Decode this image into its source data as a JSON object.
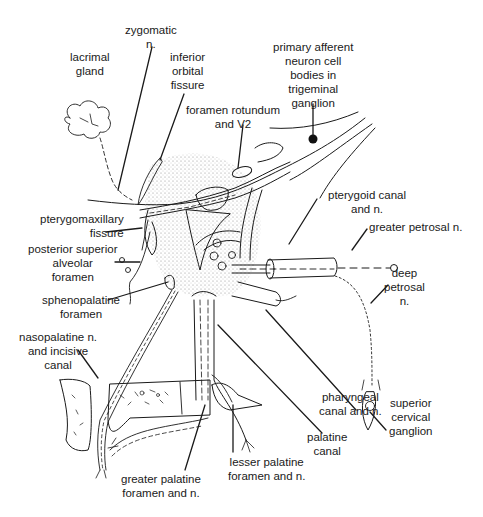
{
  "figure": {
    "colors": {
      "ink": "#1a1a1a",
      "background": "#ffffff",
      "stipple": "#9a9a9a"
    }
  },
  "labels": {
    "zygomatic_n": "zygomatic\nn.",
    "lacrimal_gland": "lacrimal\ngland",
    "inferior_orbital_fissure": "inferior\norbital\nfissure",
    "primary_afferent": "primary afferent\nneuron cell\nbodies in\ntrigeminal\nganglion",
    "foramen_rotundum": "foramen rotundum\nand V2",
    "pterygoid_canal": "pterygoid canal\nand n.",
    "greater_petrosal": "greater petrosal n.",
    "pterygomaxillary_fissure": "pterygomaxillary\nfissure",
    "posterior_superior_alveolar": "posterior superior\nalveolar\nforamen",
    "sphenopalatine_foramen": "sphenopalatine\nforamen",
    "deep_petrosal": "deep\npetrosal\nn.",
    "nasopalatine": "nasopalatine n.\nand incisive\ncanal",
    "superior_cervical_ganglion": "superior\ncervical\nganglion",
    "pharyngeal_canal": "pharyngeal\ncanal and n.",
    "palatine_canal": "palatine\ncanal",
    "lesser_palatine": "lesser palatine\nforamen and n.",
    "greater_palatine": "greater palatine\nforamen and n."
  }
}
